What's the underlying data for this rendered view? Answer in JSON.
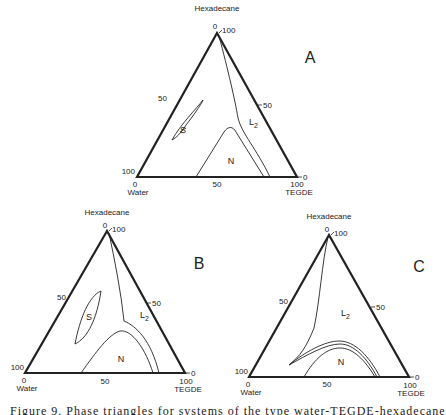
{
  "figure": {
    "caption": "Figure 9.  Phase triangles for systems of the type water-TEGDE-hexadecane",
    "components": {
      "top": "Hexadecane",
      "left": "Water",
      "right": "TEGDE"
    },
    "ticks": {
      "apex_left": "0",
      "apex_right": "100",
      "left_mid": "50",
      "right_mid": "50",
      "bl_left": "100",
      "bl_below": "0",
      "bottom_mid": "50",
      "br_below": "100",
      "br_right": "0"
    },
    "panels": [
      {
        "id": "A",
        "label": "A",
        "regions": {
          "S": "S",
          "L2": "L",
          "L2_sub": "2",
          "N": "N"
        }
      },
      {
        "id": "B",
        "label": "B",
        "regions": {
          "S": "S",
          "L2": "L",
          "L2_sub": "2",
          "N": "N"
        }
      },
      {
        "id": "C",
        "label": "C",
        "regions": {
          "L2": "L",
          "L2_sub": "2",
          "N": "N"
        }
      }
    ]
  },
  "colors": {
    "ink": "#222222",
    "background": "#ffffff"
  }
}
